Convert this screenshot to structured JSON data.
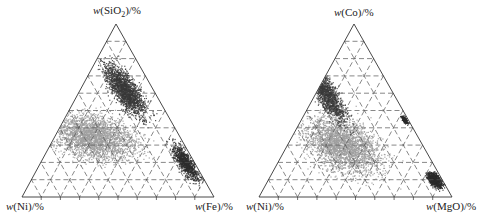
{
  "chart_data": [
    {
      "type": "scatter",
      "subtype": "ternary",
      "title": "",
      "vertices": {
        "top": "w(SiO2)/%",
        "left": "w(Ni)/%",
        "right": "w(Fe)/%"
      },
      "grid": {
        "divisions": 10,
        "style": "dashed"
      },
      "series": [
        {
          "name": "dark points",
          "color": "#3a3a3a",
          "region": "concentrated near SiO2 axis center and along Fe edge"
        },
        {
          "name": "light points",
          "color": "#a8a8a8",
          "region": "broad cloud toward Ni/Fe base"
        }
      ]
    },
    {
      "type": "scatter",
      "subtype": "ternary",
      "title": "",
      "vertices": {
        "top": "w(Co)/%",
        "left": "w(Ni)/%",
        "right": "w(MgO)/%"
      },
      "grid": {
        "divisions": 10,
        "style": "dashed"
      },
      "series": [
        {
          "name": "dark points",
          "color": "#3a3a3a",
          "region": "along left edge near Co apex and near MgO corner"
        },
        {
          "name": "light points",
          "color": "#a8a8a8",
          "region": "broad cloud center-left"
        }
      ]
    }
  ],
  "labels": {
    "left_top": {
      "pre": "w",
      "text": "(SiO",
      "sub": "2",
      "post": ")/%"
    },
    "left_bl": {
      "pre": "w",
      "text": "(Ni)/%"
    },
    "left_br": {
      "pre": "w",
      "text": "(Fe)/%"
    },
    "right_top": {
      "pre": "w",
      "text": "(Co)/%"
    },
    "right_bl": {
      "pre": "w",
      "text": "(Ni)/%"
    },
    "right_br": {
      "pre": "w",
      "text": "(MgO)/%"
    }
  }
}
